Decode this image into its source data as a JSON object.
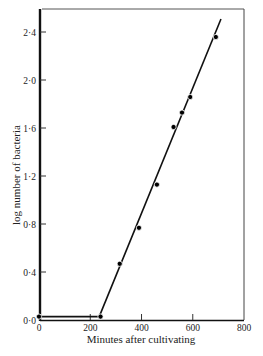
{
  "chart_data": {
    "type": "line",
    "title": "",
    "xlabel": "Minutes after cultivating",
    "ylabel": "log number of bacteria",
    "xlim": [
      0,
      800
    ],
    "ylim": [
      0,
      2.6
    ],
    "xticks": [
      0,
      200,
      400,
      600,
      800
    ],
    "xtick_labels": [
      "0",
      "200",
      "400",
      "600",
      "800"
    ],
    "yticks": [
      0.0,
      0.4,
      0.8,
      1.2,
      1.6,
      2.0,
      2.4
    ],
    "ytick_labels": [
      "0·0",
      "0·4",
      "0·8",
      "1·2",
      "1·6",
      "2·0",
      "2·4"
    ],
    "grid": false,
    "legend": null,
    "series": [
      {
        "name": "bacterial growth",
        "x": [
          0,
          240,
          315,
          390,
          460,
          525,
          558,
          590,
          690
        ],
        "y": [
          0.02,
          0.02,
          0.46,
          0.76,
          1.12,
          1.6,
          1.72,
          1.85,
          2.35
        ]
      }
    ],
    "fit_line": {
      "lag_phase": [
        [
          0,
          0.02
        ],
        [
          235,
          0.02
        ]
      ],
      "log_phase": [
        [
          235,
          0.02
        ],
        [
          710,
          2.5
        ]
      ]
    }
  }
}
